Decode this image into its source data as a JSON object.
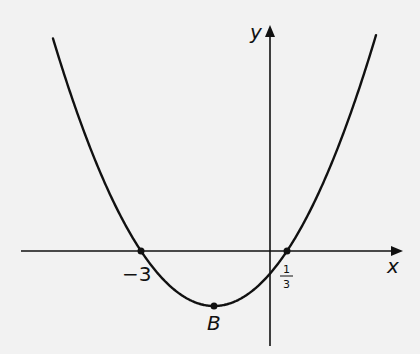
{
  "chart_data": {
    "type": "line",
    "title": "",
    "xlabel": "x",
    "ylabel": "y",
    "function_roots": [
      -3,
      0.3333
    ],
    "vertex": {
      "label": "B",
      "x": -1.3333
    },
    "points": [
      {
        "name": "root-left",
        "x": -3,
        "y": 0,
        "label": "−3"
      },
      {
        "name": "root-right",
        "x": 0.3333,
        "y": 0,
        "label_num": "1",
        "label_den": "3"
      },
      {
        "name": "vertex",
        "x": -1.3333,
        "label": "B"
      }
    ],
    "grid": false,
    "legend": null
  },
  "labels": {
    "x_axis": "x",
    "y_axis": "y",
    "root_left": "−3",
    "root_right_num": "1",
    "root_right_den": "3",
    "vertex": "B"
  },
  "pixel_layout": {
    "origin_x": 270,
    "origin_y": 251,
    "px_per_unit": 43,
    "vertex_px": [
      214,
      306
    ],
    "curve_k": 0.01032,
    "curve_x_range": [
      53,
      376
    ]
  }
}
